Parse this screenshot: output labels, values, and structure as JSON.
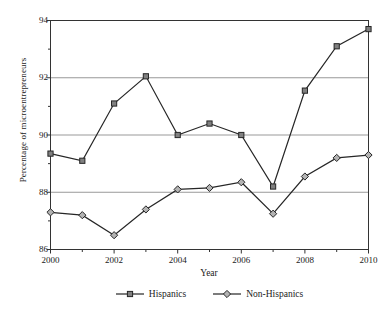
{
  "chart_data": {
    "type": "line",
    "title": "",
    "subtitle": "",
    "xlabel": "Year",
    "ylabel": "Percentage of microentrepreneurs",
    "x": [
      2000,
      2001,
      2002,
      2003,
      2004,
      2005,
      2006,
      2007,
      2008,
      2009,
      2010
    ],
    "categories": [
      "2000",
      "2001",
      "2002",
      "2003",
      "2004",
      "2005",
      "2006",
      "2007",
      "2008",
      "2009",
      "2010"
    ],
    "xlim": [
      2000,
      2010
    ],
    "ylim": [
      86,
      94
    ],
    "x_major_ticks": [
      2000,
      2002,
      2004,
      2006,
      2008,
      2010
    ],
    "x_major_tick_labels": [
      "2000",
      "2002",
      "2004",
      "2006",
      "2008",
      "2010"
    ],
    "x_minor_ticks": [
      2001,
      2003,
      2005,
      2007,
      2009
    ],
    "y_major_ticks": [
      86,
      88,
      90,
      92,
      94
    ],
    "y_major_tick_labels": [
      "86",
      "88",
      "90",
      "92",
      "94"
    ],
    "y_minor_ticks": [
      87,
      89,
      91,
      93
    ],
    "gridlines": [
      88,
      90,
      92
    ],
    "grid": true,
    "grid_axis": "y",
    "legend_position": "bottom",
    "series": [
      {
        "name": "Hispanics",
        "marker": "filled-square",
        "marker_fill": "#808080",
        "marker_edge": "#262626",
        "line_color": "#262626",
        "values": [
          89.35,
          89.1,
          91.1,
          92.05,
          90.0,
          90.4,
          90.0,
          88.2,
          91.55,
          93.1,
          93.7
        ]
      },
      {
        "name": "Non-Hispanics",
        "marker": "open-diamond",
        "marker_fill": "#b3b3b3",
        "marker_edge": "#262626",
        "line_color": "#262626",
        "values": [
          87.3,
          87.2,
          86.5,
          87.4,
          88.1,
          88.15,
          88.35,
          87.25,
          88.55,
          89.2,
          89.3
        ]
      }
    ]
  },
  "colors": {
    "axis": "#333333",
    "grid": "#999999",
    "text": "#1a1a1a",
    "background": "#ffffff"
  },
  "legend": {
    "entries": [
      {
        "label": "Hispanics"
      },
      {
        "label": "Non-Hispanics"
      }
    ]
  }
}
